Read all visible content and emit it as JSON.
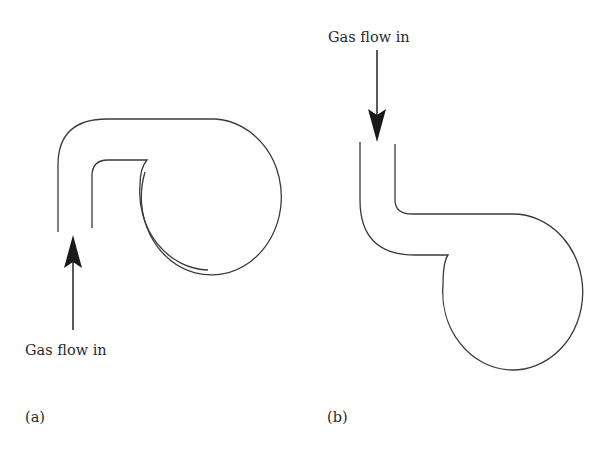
{
  "figure": {
    "panels": [
      {
        "id": "a",
        "panel_label": "(a)",
        "flow_label": "Gas flow in",
        "arrow_direction": "up",
        "description": "Tube entering from below, curving over the top into the tangential inlet of a round chamber"
      },
      {
        "id": "b",
        "panel_label": "(b)",
        "flow_label": "Gas flow in",
        "arrow_direction": "down",
        "description": "Tube entering from above, bending down and horizontally into a round chamber below"
      }
    ],
    "colors": {
      "line": "#3a3a3a",
      "arrow": "#1a1a1a",
      "text": "#2a2a2a",
      "background": "#ffffff"
    }
  }
}
